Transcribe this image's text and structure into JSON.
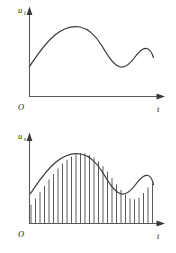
{
  "figure": {
    "background_color": "#ffffff",
    "curve_color": "#3a3a3a",
    "axis_color": "#5a5a5a",
    "bar_color": "#4a4a4a"
  },
  "panels": [
    {
      "id": "continuous-signal",
      "y_axis_label": "u",
      "y_axis_subscript": "i",
      "x_axis_label": "t",
      "origin_label": "O"
    },
    {
      "id": "sampled-signal",
      "y_axis_label": "u",
      "y_axis_subscript": "s",
      "x_axis_label": "t",
      "origin_label": "O"
    }
  ],
  "chart_data": [
    {
      "type": "line",
      "id": "continuous-signal",
      "title": "",
      "xlabel": "t",
      "ylabel": "u_i",
      "xlim": [
        0,
        1
      ],
      "ylim": [
        0,
        1
      ],
      "grid": false,
      "legend": "none",
      "annotations": [
        "O"
      ],
      "x": [
        0.0,
        0.05,
        0.1,
        0.15,
        0.2,
        0.25,
        0.3,
        0.35,
        0.4,
        0.45,
        0.5,
        0.55,
        0.6,
        0.65,
        0.7,
        0.75,
        0.8,
        0.85,
        0.9,
        0.95,
        1.0
      ],
      "y": [
        0.23,
        0.33,
        0.44,
        0.55,
        0.65,
        0.74,
        0.81,
        0.86,
        0.88,
        0.87,
        0.82,
        0.73,
        0.62,
        0.5,
        0.4,
        0.33,
        0.3,
        0.33,
        0.41,
        0.5,
        0.53
      ]
    },
    {
      "type": "bar",
      "id": "sampled-signal",
      "title": "",
      "xlabel": "t",
      "ylabel": "u_s",
      "xlim": [
        0,
        1
      ],
      "ylim": [
        0,
        1
      ],
      "grid": false,
      "legend": "none",
      "annotations": [
        "O"
      ],
      "sample_count": 28,
      "categories": [
        "s1",
        "s2",
        "s3",
        "s4",
        "s5",
        "s6",
        "s7",
        "s8",
        "s9",
        "s10",
        "s11",
        "s12",
        "s13",
        "s14",
        "s15",
        "s16",
        "s17",
        "s18",
        "s19",
        "s20",
        "s21",
        "s22",
        "s23",
        "s24",
        "s25",
        "s26",
        "s27",
        "s28"
      ],
      "values": [
        0.23,
        0.31,
        0.39,
        0.47,
        0.55,
        0.62,
        0.69,
        0.75,
        0.8,
        0.84,
        0.87,
        0.88,
        0.88,
        0.86,
        0.83,
        0.78,
        0.72,
        0.65,
        0.57,
        0.49,
        0.42,
        0.36,
        0.31,
        0.3,
        0.32,
        0.38,
        0.45,
        0.5
      ],
      "envelope_x": [
        0.0,
        0.05,
        0.1,
        0.15,
        0.2,
        0.25,
        0.3,
        0.35,
        0.4,
        0.45,
        0.5,
        0.55,
        0.6,
        0.65,
        0.7,
        0.75,
        0.8,
        0.85,
        0.9,
        0.95,
        1.0
      ],
      "envelope_y": [
        0.23,
        0.33,
        0.44,
        0.55,
        0.65,
        0.74,
        0.81,
        0.86,
        0.88,
        0.87,
        0.82,
        0.73,
        0.62,
        0.5,
        0.4,
        0.33,
        0.3,
        0.33,
        0.41,
        0.5,
        0.53
      ]
    }
  ]
}
